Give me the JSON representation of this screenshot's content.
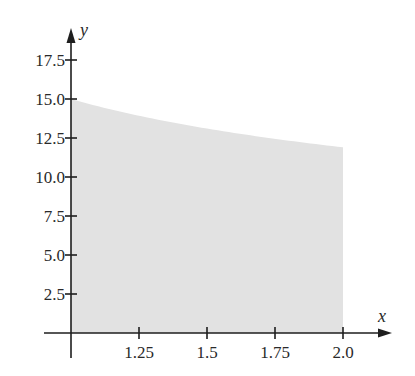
{
  "chart_data": {
    "type": "area",
    "title": "",
    "xlabel": "x",
    "ylabel": "y",
    "function": "y = 15 * x^(-1/3)",
    "x": [
      1.0,
      1.125,
      1.25,
      1.375,
      1.5,
      1.625,
      1.75,
      1.875,
      2.0
    ],
    "values": [
      15.0,
      14.42,
      13.92,
      13.49,
      13.1,
      12.76,
      12.45,
      12.17,
      11.91
    ],
    "xlim": [
      1.0,
      2.0
    ],
    "ylim": [
      0,
      17.5
    ],
    "x_ticks": [
      "1.25",
      "1.5",
      "1.75",
      "2.0"
    ],
    "y_ticks": [
      "2.5",
      "5.0",
      "7.5",
      "10.0",
      "12.5",
      "15.0",
      "17.5"
    ],
    "shaded_region": "area under curve from x=1 to x=2",
    "grid": false,
    "legend": null
  },
  "colors": {
    "fill": "#e2e2e2",
    "axis": "#1e1e1e",
    "text": "#2a2a2a"
  }
}
